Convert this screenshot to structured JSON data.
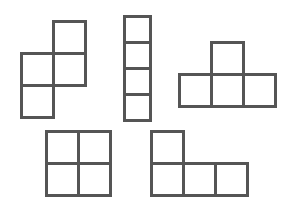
{
  "diagram": {
    "title": "",
    "line_color": "#555555",
    "background": "#ffffff",
    "cell_size": 33,
    "shapes": [
      {
        "name": "s-tetromino",
        "label": "",
        "x": 20,
        "y": 20,
        "cells": [
          [
            1,
            0
          ],
          [
            0,
            1
          ],
          [
            1,
            1
          ],
          [
            0,
            2
          ]
        ]
      },
      {
        "name": "i-tetromino",
        "label": "",
        "x": 123,
        "y": 15,
        "cell_w": 27,
        "cell_h": 27,
        "cells": [
          [
            0,
            0
          ],
          [
            0,
            1
          ],
          [
            0,
            2
          ],
          [
            0,
            3
          ]
        ]
      },
      {
        "name": "t-tetromino",
        "label": "",
        "x": 178,
        "y": 41,
        "cells": [
          [
            1,
            0
          ],
          [
            0,
            1
          ],
          [
            1,
            1
          ],
          [
            2,
            1
          ]
        ]
      },
      {
        "name": "o-tetromino",
        "label": "",
        "x": 45,
        "y": 130,
        "cells": [
          [
            0,
            0
          ],
          [
            1,
            0
          ],
          [
            0,
            1
          ],
          [
            1,
            1
          ]
        ]
      },
      {
        "name": "l-tetromino",
        "label": "",
        "x": 150,
        "y": 130,
        "cells": [
          [
            0,
            0
          ],
          [
            0,
            1
          ],
          [
            1,
            1
          ],
          [
            2,
            1
          ]
        ]
      }
    ]
  }
}
